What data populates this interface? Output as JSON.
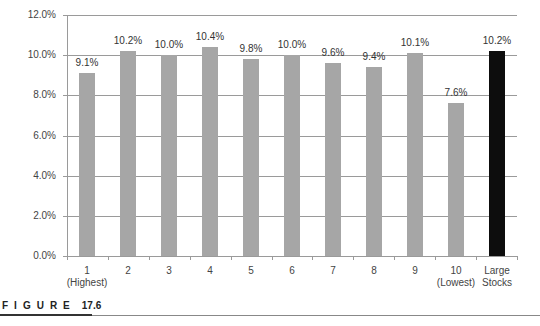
{
  "chart_data": {
    "type": "bar",
    "title": "",
    "xlabel": "",
    "ylabel": "",
    "categories": [
      "1\n(Highest)",
      "2",
      "3",
      "4",
      "5",
      "6",
      "7",
      "8",
      "9",
      "10\n(Lowest)",
      "Large\nStocks"
    ],
    "values": [
      9.1,
      10.2,
      10.0,
      10.4,
      9.8,
      10.0,
      9.6,
      9.4,
      10.1,
      7.6,
      10.2
    ],
    "data_labels": [
      "9.1%",
      "10.2%",
      "10.0%",
      "10.4%",
      "9.8%",
      "10.0%",
      "9.6%",
      "9.4%",
      "10.1%",
      "7.6%",
      "10.2%"
    ],
    "bar_colors": [
      "#a6a6a6",
      "#a6a6a6",
      "#a6a6a6",
      "#a6a6a6",
      "#a6a6a6",
      "#a6a6a6",
      "#a6a6a6",
      "#a6a6a6",
      "#a6a6a6",
      "#a6a6a6",
      "#0d0d0d"
    ],
    "ylim": [
      0,
      12
    ],
    "yticks": [
      "0.0%",
      "2.0%",
      "4.0%",
      "6.0%",
      "8.0%",
      "10.0%",
      "12.0%"
    ],
    "grid": true,
    "legend": "none"
  },
  "figure": {
    "label_word": "FIGURE",
    "label_number": "17.6"
  }
}
